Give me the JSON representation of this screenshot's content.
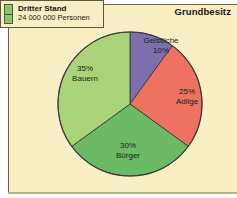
{
  "figure": {
    "title": "Grundbesitz",
    "background_color": "#faeec4",
    "border_color": "#6b6347"
  },
  "legend": {
    "swatch_color": "#8fc470",
    "title": "Dritter Stand",
    "subtitle": "24 000 000 Personen"
  },
  "chart_data": {
    "type": "pie",
    "title": "Grundbesitz",
    "xlabel": "",
    "ylabel": "",
    "unit": "%",
    "legend_position": "top-left",
    "grid": false,
    "categories": [
      "Geistliche",
      "Adlige",
      "Bürger",
      "Bauern"
    ],
    "values": [
      10,
      25,
      30,
      35
    ],
    "colors": [
      "#7d6fae",
      "#ed7262",
      "#6cba63",
      "#aad479"
    ],
    "slices": [
      {
        "name": "Geistliche",
        "percent_label": "10%",
        "value": 10,
        "color": "#7d6fae",
        "start_angle_deg": 0,
        "end_angle_deg": 36
      },
      {
        "name": "Adlige",
        "percent_label": "25%",
        "value": 25,
        "color": "#ed7262",
        "start_angle_deg": 36,
        "end_angle_deg": 126
      },
      {
        "name": "Bürger",
        "percent_label": "30%",
        "value": 30,
        "color": "#6cba63",
        "start_angle_deg": 126,
        "end_angle_deg": 234
      },
      {
        "name": "Bauern",
        "percent_label": "35%",
        "value": 35,
        "color": "#aad479",
        "start_angle_deg": 234,
        "end_angle_deg": 360
      }
    ]
  }
}
